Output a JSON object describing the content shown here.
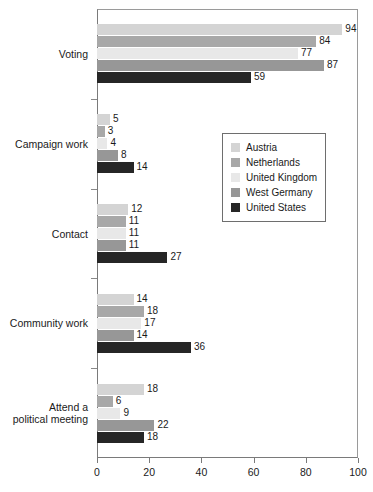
{
  "chart_data": {
    "type": "bar",
    "orientation": "horizontal",
    "title": "",
    "subtitle": "",
    "xlabel": "",
    "ylabel": "",
    "xlim": [
      0,
      100
    ],
    "xticks": [
      0,
      20,
      40,
      60,
      80,
      100
    ],
    "xtick_labels": [
      "0",
      "20",
      "40",
      "60",
      "80",
      "100"
    ],
    "grid": false,
    "legend_position": "center-right",
    "categories": [
      "Voting",
      "Campaign work",
      "Contact",
      "Community work",
      "Attend a\npolitical meeting"
    ],
    "category_labels": [
      {
        "line1": "Voting",
        "line2": ""
      },
      {
        "line1": "Campaign work",
        "line2": ""
      },
      {
        "line1": "Contact",
        "line2": ""
      },
      {
        "line1": "Community work",
        "line2": ""
      },
      {
        "line1": "Attend a",
        "line2": "political meeting"
      }
    ],
    "series": [
      {
        "name": "Austria",
        "color": "#d4d4d4",
        "values": [
          94,
          5,
          12,
          14,
          18
        ]
      },
      {
        "name": "Netherlands",
        "color": "#a8a8a8",
        "values": [
          84,
          3,
          11,
          18,
          6
        ]
      },
      {
        "name": "United Kingdom",
        "color": "#e8e8e8",
        "values": [
          77,
          4,
          11,
          17,
          9
        ]
      },
      {
        "name": "West Germany",
        "color": "#979797",
        "values": [
          87,
          8,
          11,
          14,
          22
        ]
      },
      {
        "name": "United States",
        "color": "#262626",
        "values": [
          59,
          14,
          27,
          36,
          18
        ]
      }
    ]
  },
  "legend": {
    "entries": [
      {
        "label": "Austria",
        "color": "#d4d4d4"
      },
      {
        "label": "Netherlands",
        "color": "#a8a8a8"
      },
      {
        "label": "United Kingdom",
        "color": "#e8e8e8"
      },
      {
        "label": "West Germany",
        "color": "#979797"
      },
      {
        "label": "United States",
        "color": "#262626"
      }
    ]
  }
}
